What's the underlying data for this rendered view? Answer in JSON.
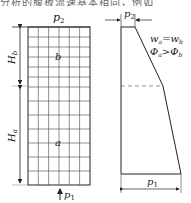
{
  "caption_fragment": "分析的腹板流速基本相同，例如",
  "left_figure": {
    "top_label": "p",
    "top_label_sub": "2",
    "bottom_label": "p",
    "bottom_label_sub": "1",
    "upper_region_label": "b",
    "lower_region_label": "a",
    "upper_height_label": "H",
    "upper_height_sub": "b",
    "lower_height_label": "H",
    "lower_height_sub": "a"
  },
  "right_figure": {
    "top_width_label": "p",
    "top_width_sub": "2",
    "bottom_width_label": "p",
    "bottom_width_sub": "1",
    "eq1": "w",
    "eq1_sub_a": "a",
    "eq1_sub_b": "b",
    "eq1_op": "=",
    "eq2": "Φ",
    "eq2_sub_a": "a",
    "eq2_sub_b": "b",
    "eq2_op": ">"
  },
  "colors": {
    "line": "#222222",
    "grid": "#333333",
    "dashed": "#666666"
  }
}
